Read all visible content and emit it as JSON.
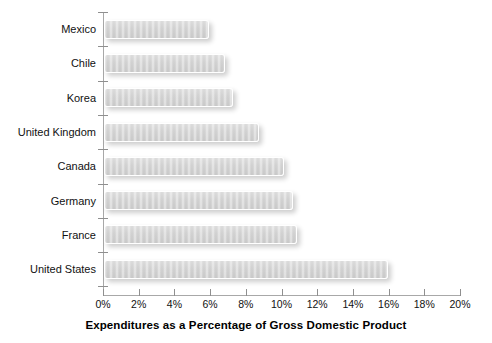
{
  "chart_data": {
    "type": "bar",
    "orientation": "horizontal",
    "title": "",
    "xlabel": "Expenditures as a Percentage of Gross Domestic Product",
    "ylabel": "",
    "categories": [
      "Mexico",
      "Chile",
      "Korea",
      "United Kingdom",
      "Canada",
      "Germany",
      "France",
      "United States"
    ],
    "values": [
      5.9,
      6.8,
      7.2,
      8.7,
      10.1,
      10.6,
      10.8,
      15.9
    ],
    "value_unit": "%",
    "xlim": [
      0,
      20
    ],
    "xticks": [
      0,
      2,
      4,
      6,
      8,
      10,
      12,
      14,
      16,
      18,
      20
    ],
    "xtick_labels": [
      "0%",
      "2%",
      "4%",
      "6%",
      "8%",
      "10%",
      "12%",
      "14%",
      "16%",
      "18%",
      "20%"
    ],
    "grid": false,
    "legend": null,
    "bar_color": "#d2d2d2",
    "bar_edge_color": "#ffffff",
    "axis_color": "#a8a8a8",
    "text_color": "#111111",
    "background_color": "#ffffff"
  }
}
